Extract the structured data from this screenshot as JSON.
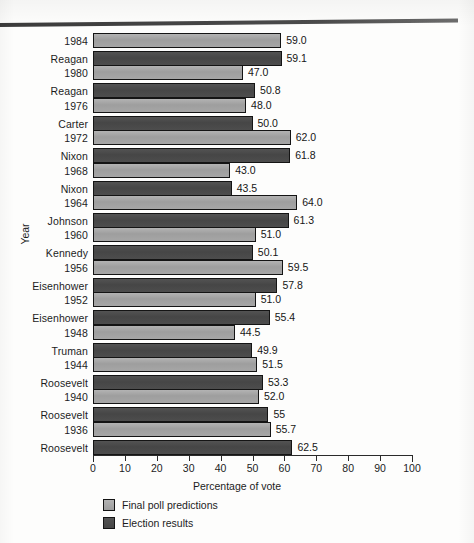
{
  "chart_data": {
    "type": "bar",
    "orientation": "horizontal",
    "title": "",
    "xlabel": "Percentage of vote",
    "ylabel": "Year",
    "xlim": [
      0,
      100
    ],
    "xticks": [
      "0",
      "10",
      "20",
      "30",
      "40",
      "50",
      "60",
      "70",
      "80",
      "90",
      "100"
    ],
    "grid": false,
    "legend_position": "below-axis-left",
    "categories": [
      "1984 Reagan",
      "1980 Reagan",
      "1976 Carter",
      "1972 Nixon",
      "1968 Nixon",
      "1964 Johnson",
      "1960 Kennedy",
      "1956 Eisenhower",
      "1952 Eisenhower",
      "1948 Truman",
      "1944 Roosevelt",
      "1940 Roosevelt",
      "1936 Roosevelt"
    ],
    "series": [
      {
        "name": "Final poll predictions",
        "color": "#a0a0a0",
        "values": [
          59.0,
          47.0,
          48.0,
          62.0,
          43.0,
          64.0,
          51.0,
          59.5,
          51.0,
          44.5,
          51.5,
          52.0,
          55.7
        ]
      },
      {
        "name": "Election results",
        "color": "#4a4a4a",
        "values": [
          59.1,
          50.8,
          50.0,
          61.8,
          43.5,
          61.3,
          50.1,
          57.8,
          55.4,
          49.9,
          53.3,
          55.0,
          62.5
        ]
      }
    ]
  },
  "groups": [
    {
      "year": "1984",
      "person": "Reagan",
      "poll": 59.0,
      "poll_label": "59.0",
      "result": 59.1,
      "result_label": "59.1"
    },
    {
      "year": "1980",
      "person": "Reagan",
      "poll": 47.0,
      "poll_label": "47.0",
      "result": 50.8,
      "result_label": "50.8"
    },
    {
      "year": "1976",
      "person": "Carter",
      "poll": 48.0,
      "poll_label": "48.0",
      "result": 50.0,
      "result_label": "50.0"
    },
    {
      "year": "1972",
      "person": "Nixon",
      "poll": 62.0,
      "poll_label": "62.0",
      "result": 61.8,
      "result_label": "61.8"
    },
    {
      "year": "1968",
      "person": "Nixon",
      "poll": 43.0,
      "poll_label": "43.0",
      "result": 43.5,
      "result_label": "43.5"
    },
    {
      "year": "1964",
      "person": "Johnson",
      "poll": 64.0,
      "poll_label": "64.0",
      "result": 61.3,
      "result_label": "61.3"
    },
    {
      "year": "1960",
      "person": "Kennedy",
      "poll": 51.0,
      "poll_label": "51.0",
      "result": 50.1,
      "result_label": "50.1"
    },
    {
      "year": "1956",
      "person": "Eisenhower",
      "poll": 59.5,
      "poll_label": "59.5",
      "result": 57.8,
      "result_label": "57.8"
    },
    {
      "year": "1952",
      "person": "Eisenhower",
      "poll": 51.0,
      "poll_label": "51.0",
      "result": 55.4,
      "result_label": "55.4"
    },
    {
      "year": "1948",
      "person": "Truman",
      "poll": 44.5,
      "poll_label": "44.5",
      "result": 49.9,
      "result_label": "49.9"
    },
    {
      "year": "1944",
      "person": "Roosevelt",
      "poll": 51.5,
      "poll_label": "51.5",
      "result": 53.3,
      "result_label": "53.3"
    },
    {
      "year": "1940",
      "person": "Roosevelt",
      "poll": 52.0,
      "poll_label": "52.0",
      "result": 55.0,
      "result_label": "55"
    },
    {
      "year": "1936",
      "person": "Roosevelt",
      "poll": 55.7,
      "poll_label": "55.7",
      "result": 62.5,
      "result_label": "62.5"
    }
  ],
  "axis": {
    "x_title": "Percentage of vote",
    "y_title": "Year",
    "ticks": [
      "0",
      "10",
      "20",
      "30",
      "40",
      "50",
      "60",
      "70",
      "80",
      "90",
      "100"
    ]
  },
  "legend": {
    "items": [
      {
        "label": "Final poll predictions",
        "kind": "poll"
      },
      {
        "label": "Election results",
        "kind": "result"
      }
    ]
  }
}
